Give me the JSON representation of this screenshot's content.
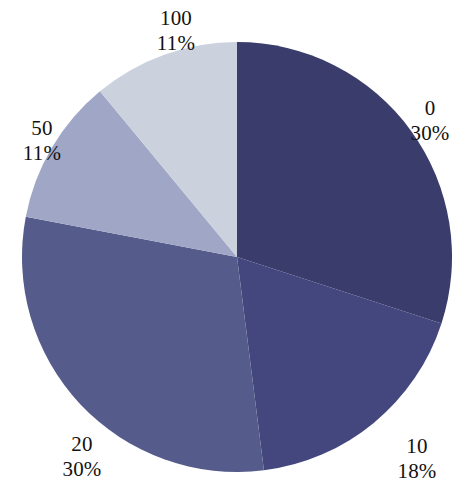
{
  "chart_data": {
    "type": "pie",
    "title": "",
    "subtitle": "",
    "xlabel": "",
    "ylabel": "",
    "legend_position": "none",
    "grid": false,
    "start_angle_deg": 0,
    "direction": "clockwise",
    "categories": [
      "0",
      "10",
      "20",
      "50",
      "100"
    ],
    "values": [
      30,
      18,
      30,
      11,
      11
    ],
    "value_unit": "%",
    "slices": [
      {
        "id": "slice-0",
        "label": "0",
        "percent": 30,
        "percent_text": "30%",
        "color": "#3a3c6b",
        "start_deg": 0,
        "end_deg": 108
      },
      {
        "id": "slice-10",
        "label": "10",
        "percent": 18,
        "percent_text": "18%",
        "color": "#43477d",
        "start_deg": 108,
        "end_deg": 172.8
      },
      {
        "id": "slice-20",
        "label": "20",
        "percent": 30,
        "percent_text": "30%",
        "color": "#555b8a",
        "start_deg": 172.8,
        "end_deg": 280.8
      },
      {
        "id": "slice-50",
        "label": "50",
        "percent": 11,
        "percent_text": "11%",
        "color": "#9fa6c6",
        "start_deg": 280.8,
        "end_deg": 320.4
      },
      {
        "id": "slice-100",
        "label": "100",
        "percent": 11,
        "percent_text": "11%",
        "color": "#ccd2dd",
        "start_deg": 320.4,
        "end_deg": 360
      }
    ],
    "geometry": {
      "center_x": 237,
      "center_y": 257,
      "radius": 215
    },
    "background_color": "#ffffff",
    "label_color": "#14120f"
  }
}
